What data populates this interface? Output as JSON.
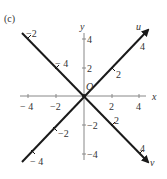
{
  "panel_label": "(c)",
  "axes": {
    "x_label": "x",
    "y_label": "y",
    "origin_label": "O",
    "x_ticks": [
      "− 4",
      "−2",
      "2",
      "4"
    ],
    "y_ticks": [
      "4",
      "2",
      "−2",
      "−4"
    ]
  },
  "rotated_axes": {
    "u_label": "u",
    "v_label": "v",
    "u_ticks": [
      "−2",
      "2",
      "4"
    ],
    "v_ticks": [
      "−2",
      "− 4",
      "2",
      "4"
    ],
    "u_neg_tick": "− 4"
  },
  "colors": {
    "axis": "#888888",
    "rotated_axis": "#1a1a1a"
  }
}
